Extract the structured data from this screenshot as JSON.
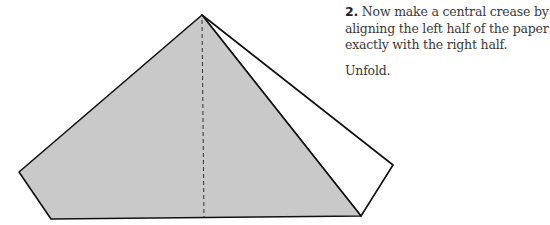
{
  "instruction": {
    "step_number": "2.",
    "text": "Now make a central crease by aligning the left half of the paper exactly with the right half.",
    "followup": "Unfold."
  },
  "diagram": {
    "paper_fill": "#c9c9c9",
    "outline_color": "#111111",
    "crease_style": "dashed"
  }
}
